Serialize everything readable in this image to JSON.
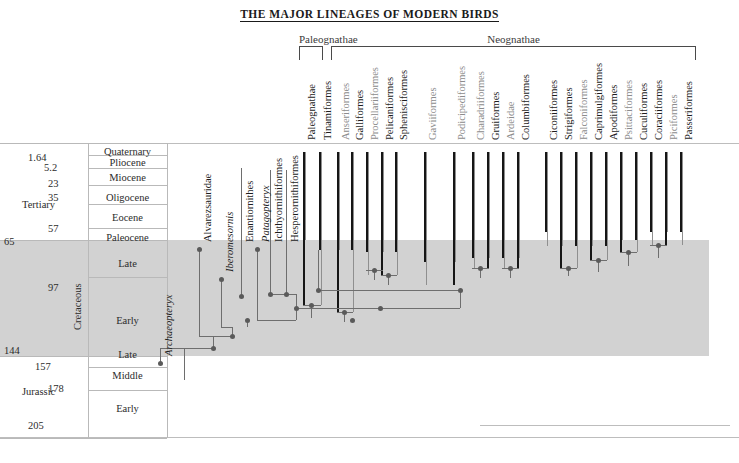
{
  "title": "THE MAJOR LINEAGES OF MODERN BIRDS",
  "clades": [
    {
      "name": "Paleognathae",
      "label_x": 298,
      "label_y": 33,
      "bracket_x": 299,
      "bracket_w": 24,
      "bracket_y": 46,
      "bracket_h": 14
    },
    {
      "name": "Neognathae",
      "label_x": 452,
      "label_y": 33,
      "bracket_x": 331,
      "bracket_w": 365,
      "bracket_y": 46,
      "bracket_h": 14
    }
  ],
  "timescale": {
    "periods": [
      {
        "name": "Tertiary",
        "vertical": false,
        "x": 22,
        "y": 199
      },
      {
        "name": "Cretaceous",
        "vertical": true,
        "x": 72,
        "y": 330
      },
      {
        "name": "Jurassic",
        "vertical": false,
        "x": 22,
        "y": 386
      }
    ],
    "epochs": [
      {
        "name": "Quaternary",
        "y": 146
      },
      {
        "name": "Pliocene",
        "y": 157
      },
      {
        "name": "Miocene",
        "y": 172
      },
      {
        "name": "Oligocene",
        "y": 192
      },
      {
        "name": "Eocene",
        "y": 212
      },
      {
        "name": "Paleocene",
        "y": 232
      },
      {
        "name": "Late",
        "y": 258
      },
      {
        "name": "Early",
        "y": 315
      },
      {
        "name": "Late",
        "y": 349
      },
      {
        "name": "Middle",
        "y": 370
      },
      {
        "name": "Early",
        "y": 403
      }
    ],
    "boundaries": [
      {
        "value": "1.64",
        "x": 28,
        "y": 152
      },
      {
        "value": "5.2",
        "x": 44,
        "y": 162
      },
      {
        "value": "23",
        "x": 48,
        "y": 178
      },
      {
        "value": "35",
        "x": 48,
        "y": 192
      },
      {
        "value": "57",
        "x": 48,
        "y": 223
      },
      {
        "value": "65",
        "x": 4,
        "y": 236
      },
      {
        "value": "97",
        "x": 48,
        "y": 282
      },
      {
        "value": "144",
        "x": 4,
        "y": 345
      },
      {
        "value": "157",
        "x": 35,
        "y": 361
      },
      {
        "value": "178",
        "x": 48,
        "y": 383
      },
      {
        "value": "205",
        "x": 28,
        "y": 420
      }
    ]
  },
  "fossil_taxa": [
    {
      "name": "Archaeopteryx",
      "italic": true,
      "x": 160,
      "node_y": 363,
      "label_y": 356
    },
    {
      "name": "Alvarezsauridae",
      "italic": false,
      "x": 199,
      "node_y": 249,
      "label_y": 242
    },
    {
      "name": "Iberomesornis",
      "italic": true,
      "x": 221,
      "node_y": 279,
      "label_y": 272
    },
    {
      "name": "Enantiornithes",
      "italic": false,
      "x": 241,
      "node_y": 296,
      "label_y": 242
    },
    {
      "name": "Patagopteryx",
      "italic": true,
      "x": 257,
      "node_y": 249,
      "label_y": 242
    },
    {
      "name": "Ichthyornithiformes",
      "italic": false,
      "x": 270,
      "node_y": 294,
      "label_y": 242
    },
    {
      "name": "Hesperornithiformes",
      "italic": false,
      "x": 286,
      "node_y": 294,
      "label_y": 242
    }
  ],
  "modern_orders": [
    {
      "name": "Paleognathae",
      "x": 303,
      "gray": false
    },
    {
      "name": "Tinamiformes",
      "x": 319,
      "gray": false
    },
    {
      "name": "Anseriformes",
      "x": 337,
      "gray": true
    },
    {
      "name": "Galliformes",
      "x": 351,
      "gray": false
    },
    {
      "name": "Procellariiformes",
      "x": 366,
      "gray": true
    },
    {
      "name": "Pelicaniformes",
      "x": 381,
      "gray": false
    },
    {
      "name": "Sphenisciformes",
      "x": 395,
      "gray": false
    },
    {
      "name": "Gaviiformes",
      "x": 424,
      "gray": true
    },
    {
      "name": "Podicipediformes",
      "x": 453,
      "gray": true
    },
    {
      "name": "Charadriiformes",
      "x": 472,
      "gray": true
    },
    {
      "name": "Gruiformes",
      "x": 487,
      "gray": false
    },
    {
      "name": "Ardeidae",
      "x": 502,
      "gray": true
    },
    {
      "name": "Columbiformes",
      "x": 517,
      "gray": false
    },
    {
      "name": "Ciconiiformes",
      "x": 545,
      "gray": false
    },
    {
      "name": "Strigiformes",
      "x": 560,
      "gray": false
    },
    {
      "name": "Falconiformes",
      "x": 575,
      "gray": true
    },
    {
      "name": "Caprimulgiformes",
      "x": 590,
      "gray": false
    },
    {
      "name": "Apodiformes",
      "x": 605,
      "gray": false
    },
    {
      "name": "Psittaciformes",
      "x": 620,
      "gray": true
    },
    {
      "name": "Cuculiformes",
      "x": 635,
      "gray": false
    },
    {
      "name": "Coraciiformes",
      "x": 650,
      "gray": false
    },
    {
      "name": "Piciformes",
      "x": 665,
      "gray": true
    },
    {
      "name": "Passeriformes",
      "x": 680,
      "gray": false
    }
  ],
  "order_labels_bottom_y": 140,
  "chart_data": {
    "type": "diagram",
    "diagram_type": "cladogram-with-stratigraphic-ranges",
    "time_axis_units": "million years ago",
    "time_axis_range": [
      205,
      0
    ],
    "shaded_interval": {
      "name": "Cretaceous",
      "from": 144,
      "to": 65
    },
    "terminal_bars": [
      {
        "taxon": "Paleognathae",
        "black_from_y": 152,
        "black_to_y": 305,
        "gray_from_y": 152,
        "gray_to_y": 240
      },
      {
        "taxon": "Tinamiformes",
        "black_from_y": 152,
        "black_to_y": 250,
        "gray_from_y": 152,
        "gray_to_y": 305
      },
      {
        "taxon": "Anseriformes",
        "black_from_y": 152,
        "black_to_y": 312,
        "gray_from_y": 152,
        "gray_to_y": 250
      },
      {
        "taxon": "Galliformes",
        "black_from_y": 152,
        "black_to_y": 250,
        "gray_from_y": 152,
        "gray_to_y": 312
      },
      {
        "taxon": "Procellariiformes",
        "black_from_y": 152,
        "black_to_y": 252,
        "gray_from_y": 152,
        "gray_to_y": 275
      },
      {
        "taxon": "Pelicaniformes",
        "black_from_y": 152,
        "black_to_y": 275,
        "gray_from_y": 152,
        "gray_to_y": 252
      },
      {
        "taxon": "Sphenisciformes",
        "black_from_y": 152,
        "black_to_y": 252,
        "gray_from_y": 152,
        "gray_to_y": 275
      },
      {
        "taxon": "Gaviiformes",
        "black_from_y": 152,
        "black_to_y": 262,
        "gray_from_y": 152,
        "gray_to_y": 285
      },
      {
        "taxon": "Podicipediformes",
        "black_from_y": 152,
        "black_to_y": 285,
        "gray_from_y": 152,
        "gray_to_y": 262
      },
      {
        "taxon": "Charadriiformes",
        "black_from_y": 152,
        "black_to_y": 258,
        "gray_from_y": 152,
        "gray_to_y": 268
      },
      {
        "taxon": "Gruiformes",
        "black_from_y": 152,
        "black_to_y": 268,
        "gray_from_y": 152,
        "gray_to_y": 258
      },
      {
        "taxon": "Ardeidae",
        "black_from_y": 152,
        "black_to_y": 258,
        "gray_from_y": 152,
        "gray_to_y": 268
      },
      {
        "taxon": "Columbiformes",
        "black_from_y": 152,
        "black_to_y": 268,
        "gray_from_y": 152,
        "gray_to_y": 258
      },
      {
        "taxon": "Ciconiiformes",
        "black_from_y": 152,
        "black_to_y": 232,
        "gray_from_y": 152,
        "gray_to_y": 246
      },
      {
        "taxon": "Strigiformes",
        "black_from_y": 152,
        "black_to_y": 268,
        "gray_from_y": 152,
        "gray_to_y": 246
      },
      {
        "taxon": "Falconiformes",
        "black_from_y": 152,
        "black_to_y": 246,
        "gray_from_y": 152,
        "gray_to_y": 268
      },
      {
        "taxon": "Caprimulgiformes",
        "black_from_y": 152,
        "black_to_y": 260,
        "gray_from_y": 152,
        "gray_to_y": 246
      },
      {
        "taxon": "Apodiformes",
        "black_from_y": 152,
        "black_to_y": 246,
        "gray_from_y": 152,
        "gray_to_y": 260
      },
      {
        "taxon": "Psittaciformes",
        "black_from_y": 152,
        "black_to_y": 252,
        "gray_from_y": 152,
        "gray_to_y": 240
      },
      {
        "taxon": "Cuculiformes",
        "black_from_y": 152,
        "black_to_y": 240,
        "gray_from_y": 152,
        "gray_to_y": 252
      },
      {
        "taxon": "Coraciiformes",
        "black_from_y": 152,
        "black_to_y": 232,
        "gray_from_y": 152,
        "gray_to_y": 245
      },
      {
        "taxon": "Piciformes",
        "black_from_y": 152,
        "black_to_y": 245,
        "gray_from_y": 152,
        "gray_to_y": 232
      },
      {
        "taxon": "Passeriformes",
        "black_from_y": 152,
        "black_to_y": 232,
        "gray_from_y": 152,
        "gray_to_y": 245
      }
    ]
  },
  "branch_segments": [
    {
      "type": "v",
      "x": 199,
      "y1": 249,
      "y2": 336
    },
    {
      "type": "v",
      "x": 221,
      "y1": 279,
      "y2": 327
    },
    {
      "type": "v",
      "x": 241,
      "y1": 168,
      "y2": 296
    },
    {
      "type": "v",
      "x": 257,
      "y1": 249,
      "y2": 320
    },
    {
      "type": "v",
      "x": 270,
      "y1": 170,
      "y2": 294
    },
    {
      "type": "v",
      "x": 286,
      "y1": 170,
      "y2": 294
    },
    {
      "type": "h",
      "y": 336,
      "x1": 199,
      "x2": 232
    },
    {
      "type": "v",
      "x": 232,
      "y1": 327,
      "y2": 336
    },
    {
      "type": "h",
      "y": 327,
      "x1": 221,
      "x2": 232
    },
    {
      "type": "v",
      "x": 213,
      "y1": 336,
      "y2": 348
    },
    {
      "type": "h",
      "y": 348,
      "x1": 160,
      "x2": 213
    },
    {
      "type": "v",
      "x": 160,
      "y1": 363,
      "y2": 348
    },
    {
      "type": "v",
      "x": 184,
      "y1": 348,
      "y2": 380
    },
    {
      "type": "h",
      "y": 320,
      "x1": 257,
      "x2": 296
    },
    {
      "type": "v",
      "x": 296,
      "y1": 294,
      "y2": 320
    },
    {
      "type": "h",
      "y": 294,
      "x1": 270,
      "x2": 296
    },
    {
      "type": "v",
      "x": 247,
      "y1": 320,
      "y2": 327
    },
    {
      "type": "h",
      "y": 308,
      "x1": 296,
      "x2": 460
    },
    {
      "type": "v",
      "x": 460,
      "y1": 290,
      "y2": 308
    },
    {
      "type": "h",
      "y": 290,
      "x1": 318,
      "x2": 460
    },
    {
      "type": "v",
      "x": 318,
      "y1": 250,
      "y2": 290
    }
  ]
}
